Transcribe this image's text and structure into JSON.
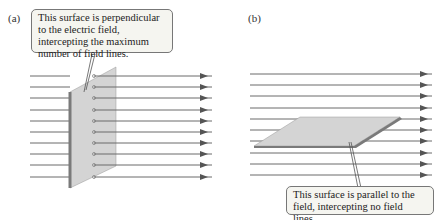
{
  "panel_a": {
    "label": "(a)",
    "callout": "This surface is perpendicular to the electric field, intercepting the maximum number of field lines.",
    "line_ys": [
      76,
      87,
      98,
      110,
      121,
      132,
      143,
      154,
      165,
      177
    ]
  },
  "panel_b": {
    "label": "(b)",
    "callout": "This surface is parallel to the field, intercepting no field lines.",
    "line_ys": [
      74,
      85,
      96,
      108,
      119,
      130,
      141,
      153,
      164,
      175
    ]
  },
  "colors": {
    "field_line": "#6a6a6a",
    "surface_face": "#d4d4d4",
    "surface_edge": "#7a7a7a",
    "callout_bg": "#f5f5f0"
  }
}
